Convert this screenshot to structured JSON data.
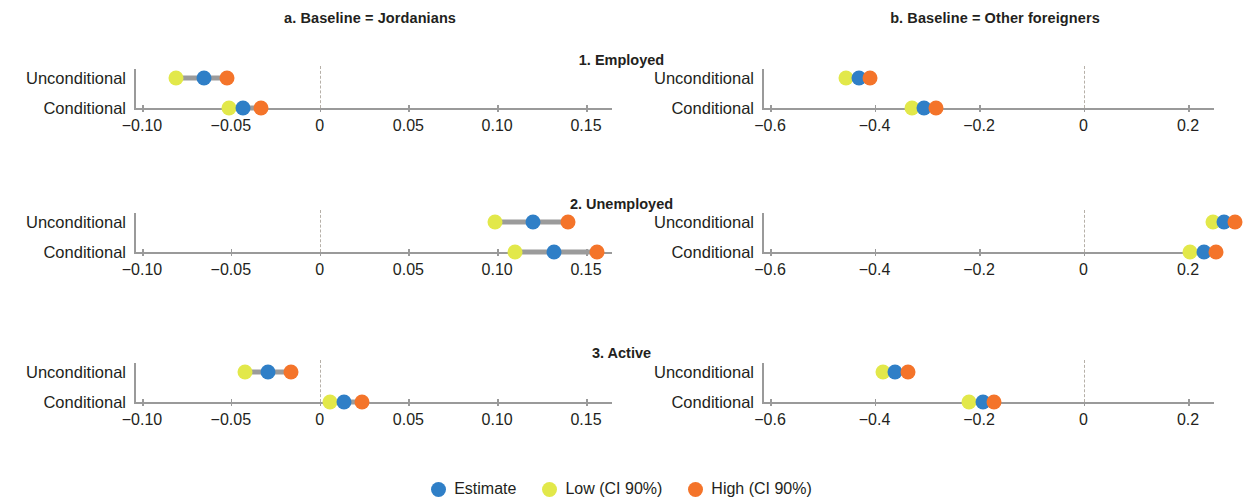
{
  "colors": {
    "estimate": "#2f7fc7",
    "low": "#e2e84a",
    "high": "#f4742a",
    "ci_bar": "#9b9b9b",
    "axis": "#9a9a9a",
    "zero_line": "#b6b0a8",
    "text": "#231f20"
  },
  "columns": [
    {
      "key": "a",
      "title": "a. Baseline = Jordanians"
    },
    {
      "key": "b",
      "title": "b. Baseline = Other foreigners"
    }
  ],
  "rows": [
    {
      "key": "employed",
      "title": "1. Employed"
    },
    {
      "key": "unemployed",
      "title": "2. Unemployed"
    },
    {
      "key": "active",
      "title": "3. Active"
    }
  ],
  "categories": [
    "Unconditional",
    "Conditional"
  ],
  "legend": {
    "position": "bottom-center",
    "items": [
      {
        "label": "Estimate",
        "color": "#2f7fc7"
      },
      {
        "label": "Low (CI 90%)",
        "color": "#e2e84a"
      },
      {
        "label": "High (CI 90%)",
        "color": "#f4742a"
      }
    ]
  },
  "axes": {
    "a": {
      "min": -0.125,
      "max": 0.175,
      "ticks": [
        -0.1,
        -0.05,
        0,
        0.05,
        0.1,
        0.15
      ],
      "tick_labels": [
        "−0.10",
        "−0.05",
        "0",
        "0.05",
        "0.10",
        "0.15"
      ],
      "zero": 0
    },
    "b": {
      "min": -0.7,
      "max": 0.31,
      "ticks": [
        -0.6,
        -0.4,
        -0.2,
        0,
        0.2
      ],
      "tick_labels": [
        "−0.6",
        "−0.4",
        "−0.2",
        "0",
        "0.2"
      ],
      "zero": 0
    }
  },
  "chart_data": {
    "type": "scatter",
    "title": "",
    "subtitle": "",
    "xlabel": "",
    "ylabel": "",
    "grid": false,
    "legend": [
      "Estimate",
      "Low (CI 90%)",
      "High (CI 90%)"
    ],
    "panels": [
      {
        "panel": "1a",
        "row": "1. Employed",
        "column": "a. Baseline = Jordanians",
        "xlim": [
          -0.125,
          0.175
        ],
        "xticks": [
          -0.1,
          -0.05,
          0,
          0.05,
          0.1,
          0.15
        ],
        "points": [
          {
            "category": "Unconditional",
            "low": -0.081,
            "estimate": -0.065,
            "high": -0.052
          },
          {
            "category": "Conditional",
            "low": -0.051,
            "estimate": -0.043,
            "high": -0.033
          }
        ]
      },
      {
        "panel": "1b",
        "row": "1. Employed",
        "column": "b. Baseline = Other foreigners",
        "xlim": [
          -0.7,
          0.31
        ],
        "xticks": [
          -0.6,
          -0.4,
          -0.2,
          0,
          0.2
        ],
        "points": [
          {
            "category": "Unconditional",
            "low": -0.455,
            "estimate": -0.43,
            "high": -0.408
          },
          {
            "category": "Conditional",
            "low": -0.328,
            "estimate": -0.305,
            "high": -0.283
          }
        ]
      },
      {
        "panel": "2a",
        "row": "2. Unemployed",
        "column": "a. Baseline = Jordanians",
        "xlim": [
          -0.125,
          0.175
        ],
        "xticks": [
          -0.1,
          -0.05,
          0,
          0.05,
          0.1,
          0.15
        ],
        "points": [
          {
            "category": "Unconditional",
            "low": 0.099,
            "estimate": 0.12,
            "high": 0.14
          },
          {
            "category": "Conditional",
            "low": 0.11,
            "estimate": 0.132,
            "high": 0.156
          }
        ]
      },
      {
        "panel": "2b",
        "row": "2. Unemployed",
        "column": "b. Baseline = Other foreigners",
        "xlim": [
          -0.7,
          0.31
        ],
        "xticks": [
          -0.6,
          -0.4,
          -0.2,
          0,
          0.2
        ],
        "points": [
          {
            "category": "Unconditional",
            "low": 0.247,
            "estimate": 0.268,
            "high": 0.289
          },
          {
            "category": "Conditional",
            "low": 0.203,
            "estimate": 0.23,
            "high": 0.254
          }
        ]
      },
      {
        "panel": "3a",
        "row": "3. Active",
        "column": "a. Baseline = Jordanians",
        "xlim": [
          -0.125,
          0.175
        ],
        "xticks": [
          -0.1,
          -0.05,
          0,
          0.05,
          0.1,
          0.15
        ],
        "points": [
          {
            "category": "Unconditional",
            "low": -0.042,
            "estimate": -0.029,
            "high": -0.016
          },
          {
            "category": "Conditional",
            "low": 0.006,
            "estimate": 0.014,
            "high": 0.024
          }
        ]
      },
      {
        "panel": "3b",
        "row": "3. Active",
        "column": "b. Baseline = Other foreigners",
        "xlim": [
          -0.7,
          0.31
        ],
        "xticks": [
          -0.6,
          -0.4,
          -0.2,
          0,
          0.2
        ],
        "points": [
          {
            "category": "Unconditional",
            "low": -0.383,
            "estimate": -0.36,
            "high": -0.335
          },
          {
            "category": "Conditional",
            "low": -0.22,
            "estimate": -0.193,
            "high": -0.172
          }
        ]
      }
    ]
  }
}
